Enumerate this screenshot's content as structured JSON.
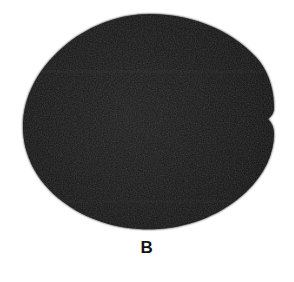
{
  "figure": {
    "kind": "grayscale-specimen-photograph",
    "panel_label": "B",
    "background_color": "#ffffff",
    "specimen": {
      "name": "dark-ovoid-mass",
      "fill_color": "#151515",
      "edge_color": "#0d0d0d",
      "texture": "fine-grain-speckle",
      "shape_description": "rounded ovoid with slight point at right",
      "bounds": {
        "left": 23,
        "top": 14,
        "right": 274,
        "bottom": 229,
        "width": 251,
        "height": 215
      },
      "outline_path": "M 150 14 C 196 14 238 34 260 62 C 270 76 274 92 274 108 C 274 112 272 116 268 119 C 272 123 274 128 274 134 C 274 154 264 175 246 192 C 224 213 192 227 158 229 C 122 231 88 221 62 201 C 36 181 23 154 23 127 C 23 96 39 66 68 43 C 91 25 120 14 150 14 Z",
      "scan_bands": [
        {
          "y": 70,
          "height": 3,
          "opacity": 0.1
        },
        {
          "y": 200,
          "height": 3,
          "opacity": 0.09
        }
      ]
    }
  }
}
